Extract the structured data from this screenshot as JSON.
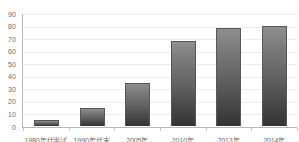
{
  "chart_data": {
    "type": "bar",
    "title": "",
    "subtitle": "",
    "xlabel": "",
    "ylabel": "",
    "categories": [
      "1980年代半ば",
      "1990年代末",
      "2005年",
      "2010年",
      "2013年",
      "2014年"
    ],
    "values": [
      5,
      14,
      34,
      68,
      78,
      80
    ],
    "ylim": [
      0,
      90
    ],
    "yticks": [
      0,
      10,
      20,
      30,
      40,
      50,
      60,
      70,
      80,
      90
    ],
    "ytick_labels": [
      "0",
      "10",
      "20",
      "30",
      "40",
      "50",
      "60",
      "70",
      "80",
      "90"
    ],
    "grid": true,
    "grid_axis": "y",
    "legend": false,
    "legend_position": "none",
    "series": [
      {
        "name": "",
        "values": [
          5,
          14,
          34,
          68,
          78,
          80
        ]
      }
    ],
    "annotations": [],
    "colors": {
      "bar_top": "#8f8f8f",
      "bar_bottom": "#343434",
      "bar_border": "#575757",
      "axis": "#b9b9b9",
      "gridline": "#ededed",
      "tick_text": "#6d6d6d",
      "background": "#ffffff"
    }
  }
}
